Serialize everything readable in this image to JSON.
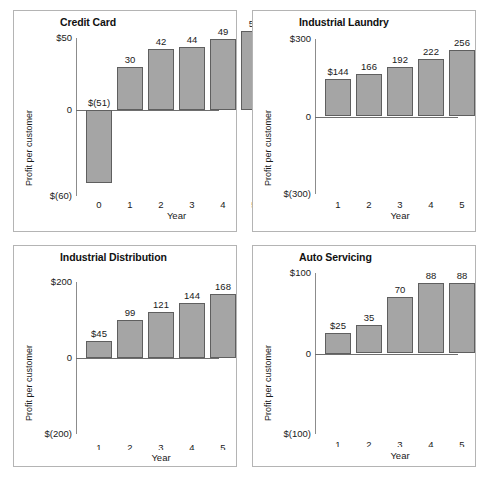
{
  "page": {
    "background": "#ffffff",
    "bar_fill": "#a5a5a5",
    "bar_border": "#5f5f5f",
    "panel_border": "#b4b4b4"
  },
  "chart_data": [
    {
      "id": "credit-card",
      "type": "bar",
      "title": "Credit Card",
      "xlabel": "Year",
      "ylabel": "Profit per customer",
      "categories": [
        "0",
        "1",
        "2",
        "3",
        "4",
        "5"
      ],
      "values": [
        -51,
        30,
        42,
        44,
        49,
        55
      ],
      "data_labels": [
        "$(51)",
        "30",
        "42",
        "44",
        "49",
        "55"
      ],
      "ylim": [
        -60,
        50
      ],
      "ytick_values": [
        50,
        0,
        -60
      ],
      "ytick_labels": [
        "$50",
        "0",
        "$(60)"
      ],
      "grid": false,
      "legend": "none"
    },
    {
      "id": "industrial-laundry",
      "type": "bar",
      "title": "Industrial Laundry",
      "xlabel": "Year",
      "ylabel": "Profit per customer",
      "categories": [
        "1",
        "2",
        "3",
        "4",
        "5"
      ],
      "values": [
        144,
        166,
        192,
        222,
        256
      ],
      "data_labels": [
        "$144",
        "166",
        "192",
        "222",
        "256"
      ],
      "ylim": [
        -300,
        300
      ],
      "ytick_values": [
        300,
        0,
        -300
      ],
      "ytick_labels": [
        "$300",
        "0",
        "$(300)"
      ],
      "grid": false,
      "legend": "none"
    },
    {
      "id": "industrial-distribution",
      "type": "bar",
      "title": "Industrial Distribution",
      "xlabel": "Year",
      "ylabel": "Profit per customer",
      "categories": [
        "1",
        "2",
        "3",
        "4",
        "5"
      ],
      "values": [
        45,
        99,
        121,
        144,
        168
      ],
      "data_labels": [
        "$45",
        "99",
        "121",
        "144",
        "168"
      ],
      "ylim": [
        -200,
        200
      ],
      "ytick_values": [
        200,
        0,
        -200
      ],
      "ytick_labels": [
        "$200",
        "0",
        "$(200)"
      ],
      "grid": false,
      "legend": "none"
    },
    {
      "id": "auto-servicing",
      "type": "bar",
      "title": "Auto Servicing",
      "xlabel": "Year",
      "ylabel": "Profit per customer",
      "categories": [
        "1",
        "2",
        "3",
        "4",
        "5"
      ],
      "values": [
        25,
        35,
        70,
        88,
        88
      ],
      "data_labels": [
        "$25",
        "35",
        "70",
        "88",
        "88"
      ],
      "ylim": [
        -100,
        100
      ],
      "ytick_values": [
        100,
        0,
        -100
      ],
      "ytick_labels": [
        "$100",
        "0",
        "$(100)"
      ],
      "grid": false,
      "legend": "none"
    }
  ]
}
